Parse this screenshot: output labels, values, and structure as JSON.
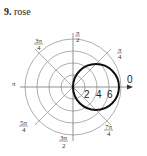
{
  "problem": {
    "number": "9.",
    "name": "rose"
  },
  "diagram": {
    "type": "polar-graph",
    "ring_labels": [
      "2",
      "4",
      "6"
    ],
    "angle_labels": {
      "zero": "0",
      "pi_over_4": {
        "num": "π",
        "den": "4"
      },
      "pi_over_2": {
        "num": "π",
        "den": "2"
      },
      "three_pi_over_4": {
        "num": "3π",
        "den": "4"
      },
      "pi": "π",
      "five_pi_over_4": {
        "num": "5π",
        "den": "4"
      },
      "three_pi_over_2": {
        "num": "3π",
        "den": "2"
      },
      "seven_pi_over_4": {
        "num": "7π",
        "den": "4"
      }
    },
    "curve": "circle through pole, diameter 6 along polar axis"
  }
}
